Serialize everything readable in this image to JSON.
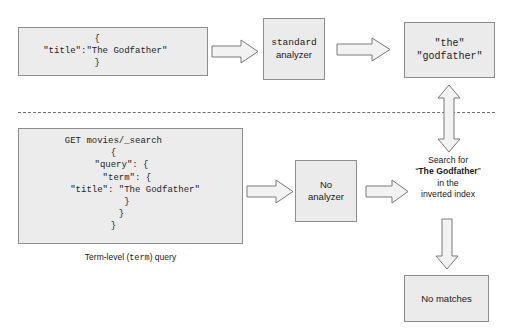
{
  "diagram": {
    "divider": {
      "style": "dashed"
    },
    "top_flow": {
      "document_box": {
        "code": "{\n   \"title\":\"The Godfather\"\n}"
      },
      "analyzer_box": {
        "line1": "standard",
        "line2": "analyzer"
      },
      "tokens_box": {
        "token1": "\"the\"",
        "token2": "\"godfather\""
      }
    },
    "bottom_flow": {
      "query_box": {
        "code": "GET movies/_search\n{\n   \"query\": {\n     \"term\": {\n        \"title\": \"The Godfather\"\n     }\n   }\n}"
      },
      "query_caption": {
        "prefix": "Term-level (",
        "mono": "term",
        "suffix": ") query"
      },
      "no_analyzer_box": {
        "line1": "No",
        "line2": "analyzer"
      },
      "search_for_text": {
        "line1": "Search for",
        "line2_quote_open": "“",
        "line2_bold": "The Godfather",
        "line2_quote_close": "”",
        "line3": "in the",
        "line4": "inverted index"
      },
      "no_matches_box": {
        "label": "No matches"
      }
    },
    "arrows": [
      {
        "name": "arrow-doc-to-analyzer",
        "direction": "right"
      },
      {
        "name": "arrow-analyzer-to-tokens",
        "direction": "right"
      },
      {
        "name": "arrow-query-to-no-analyzer",
        "direction": "right"
      },
      {
        "name": "arrow-no-analyzer-to-search",
        "direction": "right"
      },
      {
        "name": "arrow-tokens-to-search",
        "direction": "up-down"
      },
      {
        "name": "arrow-search-to-no-matches",
        "direction": "down"
      }
    ],
    "colors": {
      "box_fill": "#ebebeb",
      "box_border": "#8d8d8d",
      "arrow_fill": "#f2f2f2",
      "arrow_border": "#7a7a7a",
      "text": "#1a1a1a",
      "divider": "#6f6f6f"
    }
  }
}
